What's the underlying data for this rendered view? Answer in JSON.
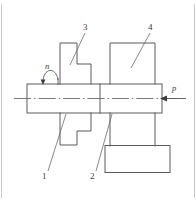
{
  "figure": {
    "type": "engineering-assembly-drawing",
    "title": "",
    "background_color": "#ffffff",
    "line_color": "#5a5a5a",
    "centerline_color": "#6b6b6b",
    "text_color": "#3c3c3c",
    "frame": {
      "left_border_visible": true,
      "right_border_visible": true
    },
    "callouts": [
      {
        "id": "1",
        "label": "1",
        "x": 44,
        "y": 178,
        "target": "shaft"
      },
      {
        "id": "2",
        "label": "2",
        "x": 92,
        "y": 178,
        "target": "shaft-step-joint"
      },
      {
        "id": "3",
        "label": "3",
        "x": 83,
        "y": 24,
        "target": "stepped-bracket"
      },
      {
        "id": "4",
        "label": "4",
        "x": 148,
        "y": 24,
        "target": "housing-block"
      }
    ],
    "symbols": [
      {
        "id": "n",
        "label": "n",
        "x": 46,
        "y": 64,
        "meaning": "rotation-speed-arrow",
        "arrow": "curved-down"
      },
      {
        "id": "p",
        "label": "p",
        "x": 172,
        "y": 85,
        "meaning": "axial-force-arrow",
        "arrow": "straight-left"
      }
    ],
    "geometry": {
      "shaft": {
        "x": 27,
        "y": 84,
        "width": 135,
        "height": 29
      },
      "shaft_divider_x": 100,
      "centerline": {
        "x1": 14,
        "x2": 186,
        "y": 98
      },
      "stepped_bracket_top": {
        "points": "60,43 60,84 91,84 91,64 77,64 77,43"
      },
      "stepped_bracket_bottom": {
        "points": "60,113 60,145 77,145 77,131 91,131 91,113"
      },
      "housing_block_top": {
        "x": 110,
        "y": 43,
        "width": 45,
        "height": 41
      },
      "housing_column": {
        "x": 110,
        "y": 113,
        "width": 45,
        "height": 32
      },
      "base_block": {
        "x": 105,
        "y": 145,
        "width": 65,
        "height": 28
      }
    }
  }
}
